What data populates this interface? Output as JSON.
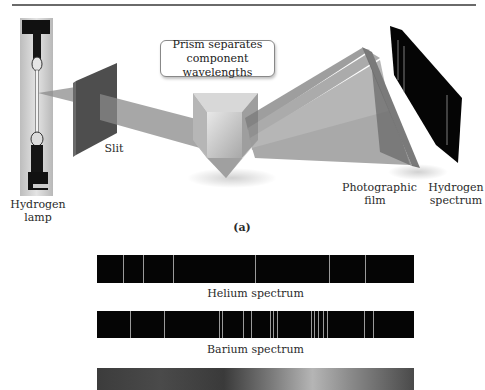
{
  "figure": {
    "part_label": "(a)",
    "callout": {
      "line1": "Prism separates",
      "line2": "component wavelengths"
    },
    "labels": {
      "lamp": {
        "line1": "Hydrogen",
        "line2": "lamp"
      },
      "slit": "Slit",
      "film": {
        "line1": "Photographic",
        "line2": "film"
      },
      "spectrum": {
        "line1": "Hydrogen",
        "line2": "spectrum"
      }
    }
  },
  "spectra": [
    {
      "name": "Helium spectrum",
      "line_positions_px": [
        26,
        46,
        76,
        158,
        232,
        268
      ]
    },
    {
      "name": "Barium spectrum",
      "line_positions_px": [
        33,
        67,
        122,
        125,
        146,
        154,
        173,
        176,
        180,
        214,
        217,
        221,
        226,
        230,
        267,
        276
      ]
    },
    {
      "name": "Continuous spectrum (partially visible)",
      "type": "gradient"
    }
  ],
  "colors": {
    "beam": "#8c8c8c",
    "spectrum_bg": "#050505",
    "spectrum_line": "#9a9a9a"
  }
}
